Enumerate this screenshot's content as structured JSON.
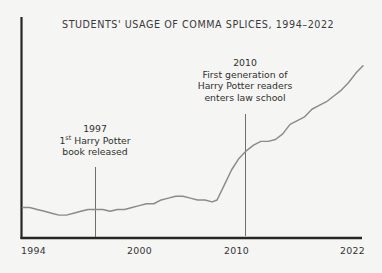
{
  "chart_data": {
    "type": "line",
    "title": "STUDENTS' USAGE OF COMMA SPLICES, 1994–2022",
    "xlabel": "",
    "ylabel": "",
    "grid": false,
    "legend": false,
    "xlim": [
      1994,
      2022
    ],
    "ylim": [
      0,
      100
    ],
    "tick_labels": {
      "x": [
        "1994",
        "2000",
        "2010",
        "2022"
      ],
      "y": []
    },
    "series": [
      {
        "name": "Usage of comma splices",
        "x": [
          1994,
          1994.6,
          1995.2,
          1995.8,
          1996.4,
          1997,
          1997.6,
          1998.2,
          1998.8,
          1999.4,
          2000,
          2000.6,
          2001.2,
          2001.8,
          2002.4,
          2003,
          2003.6,
          2004.2,
          2004.8,
          2005.4,
          2006,
          2006.6,
          2007.2,
          2007.8,
          2008.4,
          2009,
          2009.6,
          2010,
          2010.6,
          2011.2,
          2011.8,
          2012.4,
          2013,
          2013.6,
          2014.2,
          2014.8,
          2015.4,
          2016,
          2016.6,
          2017.2,
          2017.8,
          2018.4,
          2019,
          2019.6,
          2020.2,
          2020.8,
          2021.4,
          2022
        ],
        "values": [
          14,
          14,
          13,
          12,
          11,
          10,
          10,
          11,
          12,
          13,
          13,
          13,
          12,
          13,
          13,
          14,
          15,
          16,
          16,
          18,
          19,
          20,
          20,
          19,
          18,
          18,
          17,
          18,
          26,
          34,
          40,
          44,
          47,
          49,
          49,
          50,
          53,
          58,
          60,
          62,
          66,
          68,
          70,
          73,
          76,
          80,
          85,
          89
        ]
      }
    ],
    "annotations": [
      {
        "id": "1997",
        "year": "1997",
        "lines": [
          "1",
          "st",
          " Harry Potter",
          "book released"
        ],
        "line1_pre": "1",
        "line1_sup": "st",
        "line1_post": " Harry Potter",
        "line2": "book released",
        "at_x": 1997
      },
      {
        "id": "2010",
        "year": "2010",
        "line1": "First generation of",
        "line2": "Harry Potter readers",
        "line3": "enters law school",
        "at_x": 2010
      }
    ],
    "colors": {
      "background": "#f5f5f3",
      "axis": "#262626",
      "data_line": "#8b8b8b",
      "leader_line": "#6e6e6e",
      "text": "#2f2f2f",
      "title": "#3a3a3a"
    }
  }
}
